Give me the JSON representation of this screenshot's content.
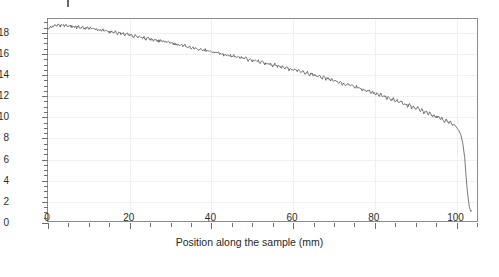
{
  "chart_data": {
    "type": "line",
    "title": "",
    "xlabel": "Position along the sample (mm)",
    "ylabel": "Deformation X direction (µm)",
    "ylabel_plain": "Deformation X direction (um)",
    "xlim": [
      0,
      105.5
    ],
    "ylim": [
      0,
      19.3
    ],
    "xticks": [
      0,
      20,
      40,
      60,
      80,
      100
    ],
    "xtick_labels": [
      "0",
      "20",
      "40",
      "60",
      "80",
      "100"
    ],
    "x_minor_step": 5,
    "yticks": [
      0,
      2,
      4,
      6,
      8,
      10,
      12,
      14,
      16,
      18
    ],
    "ytick_labels": [
      "0",
      "2",
      "4",
      "6",
      "8",
      "10",
      "12",
      "14",
      "16",
      "18"
    ],
    "y_minor_step": 0.5,
    "grid": true,
    "legend": "none",
    "line_color": "#555555",
    "grid_color": "#f0f0f2",
    "axis_color": "#8c8c8c",
    "background": "#ffffff",
    "series": [
      {
        "name": "Deformation X direction",
        "x": [
          0.0,
          0.5,
          1.0,
          1.5,
          2.0,
          2.5,
          3.0,
          3.5,
          4.0,
          4.5,
          5.0,
          5.5,
          6.0,
          6.5,
          7.0,
          7.5,
          8.0,
          8.5,
          9.0,
          9.5,
          10.0,
          10.5,
          11.0,
          11.5,
          12.0,
          12.5,
          13.0,
          13.5,
          14.0,
          14.5,
          15.0,
          15.5,
          16.0,
          16.5,
          17.0,
          17.5,
          18.0,
          18.5,
          19.0,
          19.5,
          20.0,
          20.5,
          21.0,
          21.5,
          22.0,
          22.5,
          23.0,
          23.5,
          24.0,
          24.5,
          25.0,
          25.5,
          26.0,
          26.5,
          27.0,
          27.5,
          28.0,
          28.5,
          29.0,
          29.5,
          30.0,
          30.5,
          31.0,
          31.5,
          32.0,
          32.5,
          33.0,
          33.5,
          34.0,
          34.5,
          35.0,
          35.5,
          36.0,
          36.5,
          37.0,
          37.5,
          38.0,
          38.5,
          39.0,
          39.5,
          40.0,
          40.5,
          41.0,
          41.5,
          42.0,
          42.5,
          43.0,
          43.5,
          44.0,
          44.5,
          45.0,
          45.5,
          46.0,
          46.5,
          47.0,
          47.5,
          48.0,
          48.5,
          49.0,
          49.5,
          50.0,
          50.5,
          51.0,
          51.5,
          52.0,
          52.5,
          53.0,
          53.5,
          54.0,
          54.5,
          55.0,
          55.5,
          56.0,
          56.5,
          57.0,
          57.5,
          58.0,
          58.5,
          59.0,
          59.5,
          60.0,
          60.5,
          61.0,
          61.5,
          62.0,
          62.5,
          63.0,
          63.5,
          64.0,
          64.5,
          65.0,
          65.5,
          66.0,
          66.5,
          67.0,
          67.5,
          68.0,
          68.5,
          69.0,
          69.5,
          70.0,
          70.5,
          71.0,
          71.5,
          72.0,
          72.5,
          73.0,
          73.5,
          74.0,
          74.5,
          75.0,
          75.5,
          76.0,
          76.5,
          77.0,
          77.5,
          78.0,
          78.5,
          79.0,
          79.5,
          80.0,
          80.5,
          81.0,
          81.5,
          82.0,
          82.5,
          83.0,
          83.5,
          84.0,
          84.5,
          85.0,
          85.5,
          86.0,
          86.5,
          87.0,
          87.5,
          88.0,
          88.5,
          89.0,
          89.5,
          90.0,
          90.5,
          91.0,
          91.5,
          92.0,
          92.5,
          93.0,
          93.5,
          94.0,
          94.5,
          95.0,
          95.5,
          96.0,
          96.5,
          97.0,
          97.5,
          98.0,
          98.5,
          99.0,
          99.5,
          100.0,
          100.5,
          101.0,
          101.5,
          102.0,
          102.3,
          102.6,
          102.9,
          103.1,
          103.3,
          103.5,
          103.7
        ],
        "y": [
          18.4,
          18.62,
          18.55,
          18.7,
          18.58,
          18.72,
          18.6,
          18.74,
          18.62,
          18.7,
          18.55,
          18.66,
          18.52,
          18.62,
          18.48,
          18.58,
          18.44,
          18.54,
          18.4,
          18.5,
          18.36,
          18.46,
          18.3,
          18.4,
          18.24,
          18.34,
          18.18,
          18.28,
          18.12,
          18.22,
          18.05,
          18.15,
          17.98,
          18.08,
          17.92,
          18.02,
          17.86,
          17.94,
          17.78,
          17.88,
          17.7,
          17.8,
          17.62,
          17.74,
          17.56,
          17.64,
          17.48,
          17.58,
          17.4,
          17.5,
          17.34,
          17.42,
          17.26,
          17.36,
          17.18,
          17.28,
          17.1,
          17.2,
          17.02,
          17.14,
          16.95,
          17.05,
          16.86,
          16.96,
          16.78,
          16.9,
          16.7,
          16.8,
          16.62,
          16.72,
          16.54,
          16.64,
          16.46,
          16.56,
          16.38,
          16.48,
          16.3,
          16.4,
          16.22,
          16.32,
          16.14,
          16.26,
          16.06,
          16.16,
          15.98,
          16.08,
          15.9,
          16.0,
          15.82,
          15.92,
          15.74,
          15.84,
          15.66,
          15.76,
          15.58,
          15.68,
          15.5,
          15.6,
          15.4,
          15.52,
          15.32,
          15.44,
          15.24,
          15.34,
          15.16,
          15.26,
          15.06,
          15.18,
          14.98,
          15.08,
          14.88,
          15.0,
          14.8,
          14.9,
          14.7,
          14.82,
          14.62,
          14.72,
          14.52,
          14.64,
          14.42,
          14.54,
          14.32,
          14.44,
          14.22,
          14.34,
          14.12,
          14.24,
          14.02,
          14.14,
          13.9,
          14.04,
          13.8,
          13.92,
          13.7,
          13.82,
          13.58,
          13.7,
          13.48,
          13.6,
          13.36,
          13.48,
          13.26,
          13.38,
          13.14,
          13.26,
          13.02,
          13.16,
          12.9,
          13.04,
          12.78,
          12.92,
          12.66,
          12.8,
          12.54,
          12.68,
          12.42,
          12.56,
          12.3,
          12.44,
          12.16,
          12.3,
          12.04,
          12.18,
          11.9,
          12.04,
          11.76,
          11.9,
          11.62,
          11.76,
          11.48,
          11.62,
          11.34,
          11.48,
          11.2,
          11.34,
          11.04,
          11.2,
          10.9,
          11.04,
          10.74,
          10.9,
          10.6,
          10.74,
          10.44,
          10.6,
          10.28,
          10.44,
          10.12,
          10.28,
          9.96,
          10.12,
          9.8,
          9.96,
          9.62,
          9.78,
          9.46,
          9.62,
          9.28,
          9.44,
          9.1,
          8.8,
          8.4,
          7.6,
          6.2,
          4.6,
          3.2,
          2.2,
          1.6,
          1.3,
          1.1,
          1.15
        ],
        "y_noise_amp": 0.13,
        "start_value": 18.5,
        "end_value": 1.2,
        "trend": "decreasing"
      }
    ],
    "annotations": []
  },
  "axes": {
    "y_axis_label": "Deformation X direction (µm)",
    "x_axis_label": "Position along the sample (mm)"
  }
}
